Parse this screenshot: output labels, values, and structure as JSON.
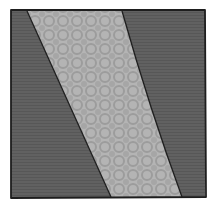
{
  "image": {
    "description": "Hand-drawn quilt block: square with two dark gray triangular corners and a diagonal light gray patterned band",
    "colors": {
      "background": "#ffffff",
      "dark_fabric": "#5f5f5f",
      "dark_fabric_texture": "#555555",
      "light_fabric": "#b4b4b4",
      "light_pattern": "#9c9c9c",
      "outline": "#1e1e1e"
    }
  }
}
